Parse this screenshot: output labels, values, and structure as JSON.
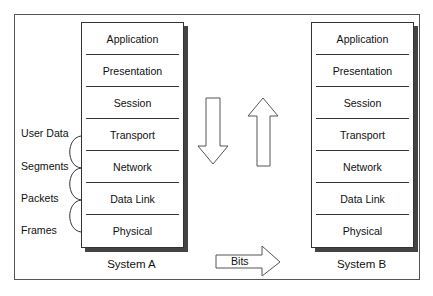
{
  "diagram": {
    "system_a": {
      "caption": "System A",
      "layers": [
        "Application",
        "Presentation",
        "Session",
        "Transport",
        "Network",
        "Data Link",
        "Physical"
      ]
    },
    "system_b": {
      "caption": "System B",
      "layers": [
        "Application",
        "Presentation",
        "Session",
        "Transport",
        "Network",
        "Data Link",
        "Physical"
      ]
    },
    "pdu_labels": [
      "User Data",
      "Segments",
      "Packets",
      "Frames"
    ],
    "bits_label": "Bits",
    "arrows": [
      "down-arrow",
      "up-arrow",
      "right-arrow"
    ]
  }
}
